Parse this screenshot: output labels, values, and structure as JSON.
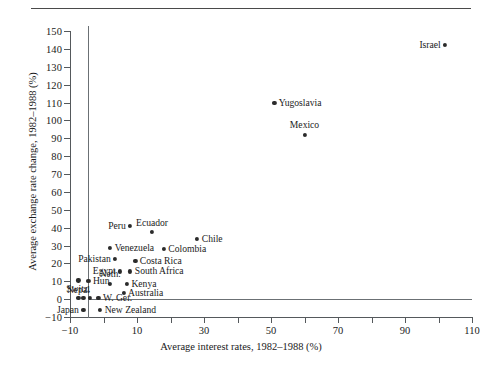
{
  "figure": {
    "has_top_rule": true,
    "background_color": "#ffffff",
    "marker_color": "#2b2b2b",
    "axis_color": "#55595c"
  },
  "chart_data": {
    "type": "scatter",
    "title": "",
    "xlabel": "Average interest rates, 1982–1988 (%)",
    "ylabel": "Average exchange rate change, 1982–1988 (%)",
    "xlim": [
      -10,
      110
    ],
    "ylim": [
      -10,
      150
    ],
    "xticks": [
      -10,
      0,
      10,
      20,
      30,
      40,
      50,
      60,
      70,
      80,
      90,
      100,
      110
    ],
    "xtick_labels": [
      "−10",
      "10",
      "30",
      "50",
      "70",
      "90",
      "110"
    ],
    "xtick_labeled_values": [
      -10,
      10,
      30,
      50,
      70,
      90,
      110
    ],
    "yticks": [
      -10,
      0,
      10,
      20,
      30,
      40,
      50,
      60,
      70,
      80,
      90,
      100,
      110,
      120,
      130,
      140,
      150
    ],
    "ytick_labels": [
      "−10",
      "0",
      "10",
      "20",
      "30",
      "40",
      "50",
      "60",
      "70",
      "80",
      "90",
      "100",
      "110",
      "120",
      "130",
      "140",
      "150"
    ],
    "grid": false,
    "legend": null,
    "reference_lines": [
      {
        "orientation": "vertical",
        "value": 0
      },
      {
        "orientation": "horizontal",
        "value": 0
      }
    ],
    "points": [
      {
        "label": "Israel",
        "x": 102.0,
        "y": 142.0,
        "label_pos": "left"
      },
      {
        "label": "Yugoslavia",
        "x": 51.0,
        "y": 110.0,
        "label_pos": "right"
      },
      {
        "label": "Mexico",
        "x": 60.0,
        "y": 92.0,
        "label_pos": "above"
      },
      {
        "label": "Peru",
        "x": 8.0,
        "y": 41.0,
        "label_pos": "left"
      },
      {
        "label": "Ecuador",
        "x": 14.5,
        "y": 37.5,
        "label_pos": "above"
      },
      {
        "label": "Chile",
        "x": 28.0,
        "y": 33.5,
        "label_pos": "right"
      },
      {
        "label": "Venezuela",
        "x": 2.0,
        "y": 28.5,
        "label_pos": "right"
      },
      {
        "label": "Colombia",
        "x": 18.0,
        "y": 28.0,
        "label_pos": "right"
      },
      {
        "label": "Pakistan",
        "x": 3.5,
        "y": 22.5,
        "label_pos": "left"
      },
      {
        "label": "Costa Rica",
        "x": 9.5,
        "y": 21.5,
        "label_pos": "right"
      },
      {
        "label": "South Africa",
        "x": 8.0,
        "y": 15.5,
        "label_pos": "right"
      },
      {
        "label": "Egypt",
        "x": 5.0,
        "y": 15.5,
        "label_pos": "left"
      },
      {
        "label": "Nepal",
        "x": -7.5,
        "y": 10.5,
        "label_pos": "below"
      },
      {
        "label": "Hun.",
        "x": -4.5,
        "y": 10.0,
        "label_pos": "right"
      },
      {
        "label": "Neth.",
        "x": 2.0,
        "y": 8.5,
        "label_pos": "above"
      },
      {
        "label": "Kenya",
        "x": 7.0,
        "y": 8.5,
        "label_pos": "right"
      },
      {
        "label": "Australia",
        "x": 6.0,
        "y": 3.5,
        "label_pos": "right"
      },
      {
        "label": "Switz.",
        "x": -7.5,
        "y": 0.5,
        "label_pos": "above"
      },
      {
        "label": "W. Ger.",
        "x": -1.5,
        "y": 0.5,
        "label_pos": "right"
      },
      {
        "label": "Japan",
        "x": -6.0,
        "y": -6.0,
        "label_pos": "left"
      },
      {
        "label": "New Zealand",
        "x": -1.0,
        "y": -6.0,
        "label_pos": "right"
      }
    ],
    "extra_markers": [
      {
        "x": -4.0,
        "y": 0.5
      },
      {
        "x": -6.0,
        "y": 0.5
      }
    ]
  }
}
